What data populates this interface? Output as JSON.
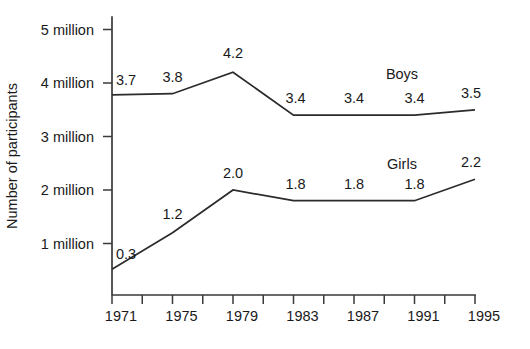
{
  "chart_data": {
    "type": "line",
    "title": "",
    "xlabel": "",
    "ylabel": "Number of participants",
    "x": [
      1971,
      1975,
      1979,
      1983,
      1987,
      1991,
      1995
    ],
    "xtick_labels": [
      "1971",
      "1975",
      "1979",
      "1983",
      "1987",
      "1991",
      "1995"
    ],
    "ytick_labels": [
      "1 million",
      "2 million",
      "3 million",
      "4 million",
      "5 million"
    ],
    "ytick_values": [
      1,
      2,
      3,
      4,
      5
    ],
    "ylim": [
      0,
      5.4
    ],
    "xlim": [
      1971,
      1995
    ],
    "grid": false,
    "legend_position": "inline-right",
    "minor_xticks": [
      1973,
      1977,
      1981,
      1985,
      1989,
      1993
    ],
    "series": [
      {
        "name": "Boys",
        "values": [
          3.7,
          3.8,
          4.2,
          3.4,
          3.4,
          3.4,
          3.5
        ],
        "point_labels": [
          "3.7",
          "3.8",
          "4.2",
          "3.4",
          "3.4",
          "3.4",
          "3.5"
        ],
        "color": "#2b2b2b"
      },
      {
        "name": "Girls",
        "values": [
          0.3,
          1.2,
          2.0,
          1.8,
          1.8,
          1.8,
          2.2
        ],
        "point_labels": [
          "0.3",
          "1.2",
          "2.0",
          "1.8",
          "1.8",
          "1.8",
          "2.2"
        ],
        "color": "#2b2b2b"
      }
    ]
  },
  "annotations": {
    "boys_label": "Boys",
    "girls_label": "Girls"
  }
}
